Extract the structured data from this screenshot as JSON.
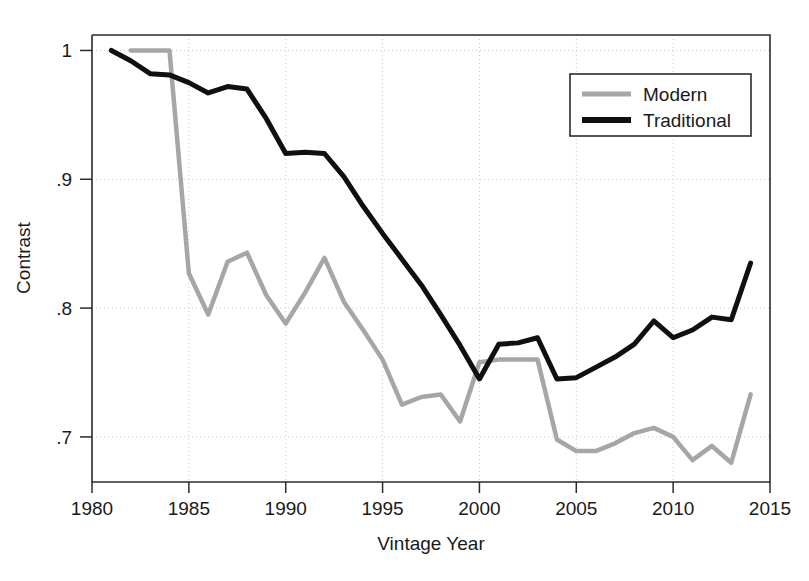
{
  "chart_data": {
    "type": "line",
    "title": "",
    "xlabel": "Vintage Year",
    "ylabel": "Contrast",
    "xlim": [
      1980,
      2015
    ],
    "ylim": [
      0.665,
      1.012
    ],
    "grid": true,
    "legend_position": "top-right",
    "xticks": [
      "1980",
      "1985",
      "1990",
      "1995",
      "2000",
      "2005",
      "2010",
      "2015"
    ],
    "xtick_values": [
      1980,
      1985,
      1990,
      1995,
      2000,
      2005,
      2010,
      2015
    ],
    "yticks": [
      "1",
      ".9",
      ".8",
      ".7"
    ],
    "ytick_values": [
      1,
      0.9,
      0.8,
      0.7
    ],
    "series": [
      {
        "name": "Modern",
        "color": "#a6a6a6",
        "linewidth": 4.5,
        "x": [
          1982,
          1983,
          1984,
          1985,
          1986,
          1987,
          1988,
          1989,
          1990,
          1991,
          1992,
          1993,
          1994,
          1995,
          1996,
          1997,
          1998,
          1999,
          2000,
          2001,
          2002,
          2003,
          2004,
          2005,
          2006,
          2007,
          2008,
          2009,
          2010,
          2011,
          2012,
          2013,
          2014
        ],
        "values": [
          1.0,
          1.0,
          1.0,
          0.827,
          0.795,
          0.836,
          0.843,
          0.81,
          0.788,
          0.812,
          0.839,
          0.805,
          0.783,
          0.76,
          0.725,
          0.731,
          0.733,
          0.712,
          0.758,
          0.76,
          0.76,
          0.76,
          0.698,
          0.689,
          0.689,
          0.695,
          0.703,
          0.707,
          0.7,
          0.682,
          0.693,
          0.68,
          0.733
        ]
      },
      {
        "name": "Traditional",
        "color": "#101010",
        "linewidth": 5,
        "x": [
          1981,
          1982,
          1983,
          1984,
          1985,
          1986,
          1987,
          1988,
          1989,
          1990,
          1991,
          1992,
          1993,
          1994,
          1995,
          1996,
          1997,
          1998,
          1999,
          2000,
          2001,
          2002,
          2003,
          2004,
          2005,
          2006,
          2007,
          2008,
          2009,
          2010,
          2011,
          2012,
          2013,
          2014
        ],
        "values": [
          1.0,
          0.992,
          0.982,
          0.981,
          0.975,
          0.967,
          0.972,
          0.97,
          0.947,
          0.92,
          0.921,
          0.92,
          0.902,
          0.879,
          0.858,
          0.838,
          0.818,
          0.795,
          0.771,
          0.745,
          0.772,
          0.773,
          0.777,
          0.745,
          0.746,
          0.754,
          0.762,
          0.772,
          0.79,
          0.777,
          0.783,
          0.793,
          0.791,
          0.835
        ]
      }
    ]
  },
  "legend": {
    "entries": [
      {
        "label": "Modern",
        "color": "#a6a6a6"
      },
      {
        "label": "Traditional",
        "color": "#101010"
      }
    ]
  },
  "axes": {
    "x_title": "Vintage Year",
    "y_title": "Contrast"
  }
}
